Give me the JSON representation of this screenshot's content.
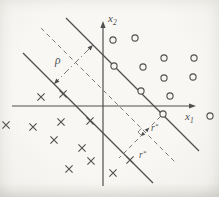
{
  "figure": {
    "kind": "svm-optimal-hyperplane-margin-diagram",
    "paper_color": "#f7f6f3",
    "ink_color": "#4f4f4f",
    "dash_color": "#7a7a7a"
  },
  "axes": {
    "x": {
      "label": "x",
      "sub": "1",
      "start": [
        12,
        106
      ],
      "end": [
        192,
        106
      ],
      "arrow_tip": [
        196,
        106
      ],
      "arrow_dir": [
        1,
        0
      ],
      "label_pos": [
        185,
        120
      ]
    },
    "y": {
      "label": "x",
      "sub": "2",
      "start": [
        103,
        186
      ],
      "end": [
        103,
        25
      ],
      "arrow_tip": [
        103,
        21
      ],
      "arrow_dir": [
        0,
        -1
      ],
      "label_pos": [
        108,
        22
      ]
    }
  },
  "chart_data": {
    "type": "scatter",
    "xlabel": "x1",
    "ylabel": "x2",
    "grid": false,
    "series": [
      {
        "name": "positive-class-circles",
        "marker": "circle",
        "points": [
          [
            113,
            40
          ],
          [
            135,
            38
          ],
          [
            114,
            66
          ],
          [
            143,
            67
          ],
          [
            164,
            58
          ],
          [
            194,
            58
          ],
          [
            164,
            78
          ],
          [
            193,
            77
          ],
          [
            141,
            91
          ],
          [
            170,
            96
          ],
          [
            163,
            114
          ],
          [
            210,
            116
          ]
        ],
        "support_vectors_on_line": [
          [
            114,
            66
          ],
          [
            141,
            91
          ],
          [
            163,
            114
          ]
        ]
      },
      {
        "name": "negative-class-crosses",
        "marker": "cross",
        "points": [
          [
            41,
            97
          ],
          [
            63,
            94
          ],
          [
            6,
            125
          ],
          [
            33,
            127
          ],
          [
            61,
            122
          ],
          [
            90,
            121
          ],
          [
            54,
            140
          ],
          [
            82,
            148
          ],
          [
            91,
            161
          ],
          [
            69,
            169
          ],
          [
            130,
            160
          ],
          [
            113,
            173
          ]
        ],
        "support_vectors_on_line": [
          [
            63,
            94
          ],
          [
            90,
            121
          ],
          [
            130,
            160
          ]
        ]
      }
    ],
    "lines": [
      {
        "name": "upper-boundary-line",
        "style": "solid",
        "from": [
          66,
          18
        ],
        "to": [
          199,
          151
        ]
      },
      {
        "name": "lower-boundary-line",
        "style": "solid",
        "from": [
          23,
          53
        ],
        "to": [
          153,
          183
        ]
      },
      {
        "name": "separating-hyperplane",
        "style": "dashed",
        "from": [
          41,
          28
        ],
        "to": [
          176,
          163
        ]
      },
      {
        "name": "margin-width-indicator",
        "style": "dashdot",
        "from": [
          54,
          84
        ],
        "to": [
          93,
          45
        ],
        "arrow_start": true,
        "arrow_end": true
      },
      {
        "name": "support-vector-distance",
        "style": "dashed",
        "from": [
          160.5,
          116.5
        ],
        "to": [
          119,
          158
        ],
        "mid_arrows_at": [
          145,
          132
        ]
      }
    ],
    "annotations": [
      {
        "type": "text",
        "name": "rho-label",
        "text": "ρ",
        "x": 55,
        "y": 64,
        "size": 11.5
      },
      {
        "type": "text",
        "name": "r-star-upper-label",
        "text": "r",
        "sup": "*",
        "x": 151,
        "y": 131,
        "size": 9.5
      },
      {
        "type": "text",
        "name": "r-star-lower-label",
        "text": "r",
        "sup": "*",
        "x": 139,
        "y": 158,
        "size": 9.5
      },
      {
        "type": "angle",
        "name": "right-angle-marker",
        "x": 145,
        "y": 132,
        "size": 5
      }
    ]
  }
}
